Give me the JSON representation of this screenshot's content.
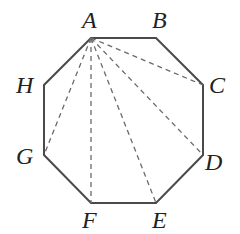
{
  "diagram": {
    "stroke_color": "#4a4a4a",
    "vertices": [
      {
        "name": "A",
        "x": 91,
        "y": 38,
        "lx": 82,
        "ly": 28
      },
      {
        "name": "B",
        "x": 156,
        "y": 38,
        "lx": 152,
        "ly": 28
      },
      {
        "name": "C",
        "x": 203,
        "y": 85,
        "lx": 209,
        "ly": 93
      },
      {
        "name": "D",
        "x": 203,
        "y": 155,
        "lx": 205,
        "ly": 170
      },
      {
        "name": "E",
        "x": 156,
        "y": 203,
        "lx": 152,
        "ly": 228
      },
      {
        "name": "F",
        "x": 91,
        "y": 203,
        "lx": 82,
        "ly": 228
      },
      {
        "name": "G",
        "x": 44,
        "y": 155,
        "lx": 16,
        "ly": 164
      },
      {
        "name": "H",
        "x": 44,
        "y": 85,
        "lx": 16,
        "ly": 93
      }
    ],
    "diagonals_from": "A",
    "diagonals_to": [
      "C",
      "D",
      "E",
      "F",
      "G"
    ]
  }
}
